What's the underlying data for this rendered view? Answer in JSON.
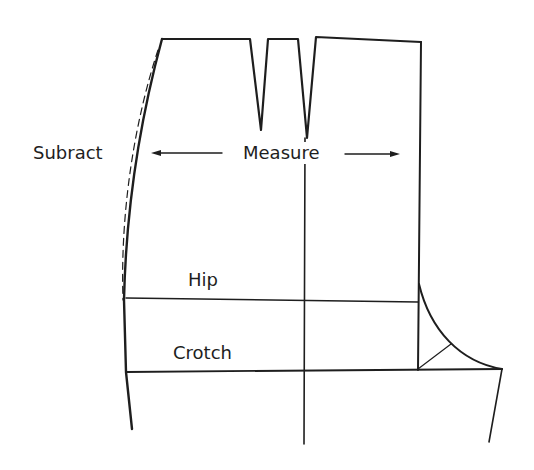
{
  "diagram": {
    "type": "pattern-drafting-diagram",
    "labels": {
      "subtract": "Subract",
      "measure": "Measure",
      "hip": "Hip",
      "crotch": "Crotch"
    },
    "elements": {
      "waistline_darts": 2,
      "arrows": [
        "left-arrow",
        "right-arrow"
      ],
      "dashed_original_side_seam": true,
      "crotch_curve": true,
      "crotch_bisector": true
    },
    "colors": {
      "line": "#1e1e1e",
      "background": "#ffffff"
    }
  }
}
